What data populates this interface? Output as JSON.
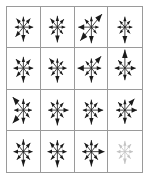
{
  "figure": {
    "title": "",
    "kind": "arrow-starburst-grid",
    "rows": 4,
    "cols": 4,
    "border_color": "#9a9a9a",
    "background_color": "#ffffff",
    "default_arrow_color": "#1a1a1a",
    "faded_arrow_color": "#c3c3c3"
  },
  "chart_data": {
    "type": "scatter",
    "title": "",
    "xlabel": "",
    "ylabel": "",
    "grid": true,
    "legend": "none",
    "directions_deg": [
      0,
      45,
      90,
      135,
      180,
      225,
      270,
      315
    ],
    "panels": [
      {
        "row": 1,
        "col": 1,
        "color": "#1a1a1a",
        "lengths": [
          0.3,
          0.3,
          0.26,
          0.3,
          0.26,
          0.34,
          0.36,
          0.24
        ]
      },
      {
        "row": 1,
        "col": 2,
        "color": "#1a1a1a",
        "lengths": [
          0.24,
          0.28,
          0.28,
          0.3,
          0.26,
          0.26,
          0.38,
          0.24
        ]
      },
      {
        "row": 1,
        "col": 3,
        "color": "#1a1a1a",
        "lengths": [
          0.22,
          0.46,
          0.26,
          0.28,
          0.4,
          0.48,
          0.4,
          0.22
        ]
      },
      {
        "row": 1,
        "col": 4,
        "color": "#1a1a1a",
        "lengths": [
          0.22,
          0.22,
          0.26,
          0.22,
          0.22,
          0.22,
          0.4,
          0.22
        ]
      },
      {
        "row": 2,
        "col": 1,
        "color": "#1a1a1a",
        "lengths": [
          0.3,
          0.3,
          0.28,
          0.32,
          0.3,
          0.3,
          0.36,
          0.26
        ]
      },
      {
        "row": 2,
        "col": 2,
        "color": "#1a1a1a",
        "lengths": [
          0.28,
          0.24,
          0.24,
          0.34,
          0.28,
          0.26,
          0.36,
          0.24
        ]
      },
      {
        "row": 2,
        "col": 3,
        "color": "#1a1a1a",
        "lengths": [
          0.3,
          0.42,
          0.24,
          0.24,
          0.42,
          0.26,
          0.36,
          0.24
        ]
      },
      {
        "row": 2,
        "col": 4,
        "color": "#1a1a1a",
        "lengths": [
          0.32,
          0.26,
          0.46,
          0.28,
          0.3,
          0.26,
          0.3,
          0.26
        ]
      },
      {
        "row": 3,
        "col": 1,
        "color": "#1a1a1a",
        "lengths": [
          0.26,
          0.28,
          0.28,
          0.46,
          0.28,
          0.46,
          0.34,
          0.26
        ]
      },
      {
        "row": 3,
        "col": 2,
        "color": "#1a1a1a",
        "lengths": [
          0.34,
          0.26,
          0.26,
          0.28,
          0.28,
          0.28,
          0.38,
          0.26
        ]
      },
      {
        "row": 3,
        "col": 3,
        "color": "#1a1a1a",
        "lengths": [
          0.36,
          0.26,
          0.26,
          0.28,
          0.26,
          0.28,
          0.36,
          0.26
        ]
      },
      {
        "row": 3,
        "col": 4,
        "color": "#1a1a1a",
        "lengths": [
          0.36,
          0.4,
          0.26,
          0.28,
          0.26,
          0.26,
          0.34,
          0.26
        ]
      },
      {
        "row": 4,
        "col": 1,
        "color": "#1a1a1a",
        "lengths": [
          0.28,
          0.3,
          0.3,
          0.3,
          0.3,
          0.28,
          0.36,
          0.28
        ]
      },
      {
        "row": 4,
        "col": 2,
        "color": "#1a1a1a",
        "lengths": [
          0.28,
          0.28,
          0.28,
          0.32,
          0.3,
          0.28,
          0.38,
          0.28
        ]
      },
      {
        "row": 4,
        "col": 3,
        "color": "#1a1a1a",
        "lengths": [
          0.4,
          0.28,
          0.28,
          0.3,
          0.28,
          0.28,
          0.36,
          0.28
        ]
      },
      {
        "row": 4,
        "col": 4,
        "color": "#c3c3c3",
        "lengths": [
          0.24,
          0.26,
          0.26,
          0.26,
          0.24,
          0.24,
          0.3,
          0.24
        ]
      }
    ]
  }
}
